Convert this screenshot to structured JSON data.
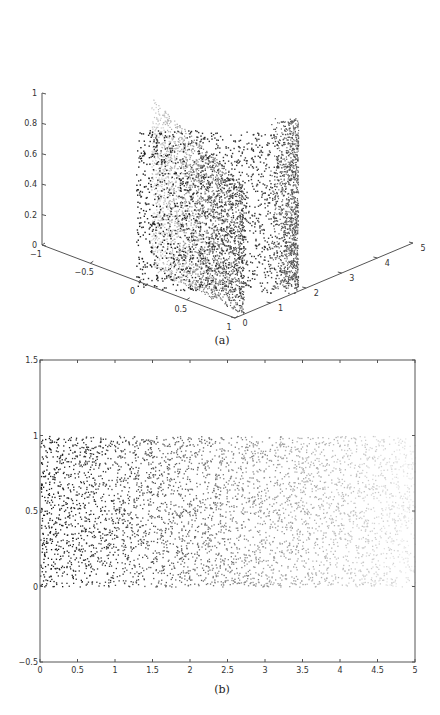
{
  "chart_data": [
    {
      "id": "a",
      "type": "scatter",
      "projection": "3d",
      "caption": "(a)",
      "title": "",
      "xlabel": "",
      "ylabel": "",
      "zlabel": "",
      "xlim": [
        -1,
        1
      ],
      "ylim": [
        0,
        5
      ],
      "zlim": [
        0,
        1
      ],
      "x_ticks": [
        "-1",
        "-0.5",
        "0",
        "0.5",
        "1"
      ],
      "y_ticks": [
        "0",
        "1",
        "2",
        "3",
        "4",
        "5"
      ],
      "z_ticks": [
        "0",
        "0.2",
        "0.4",
        "0.6",
        "0.8",
        "1"
      ],
      "grid": false,
      "description": "Points uniformly filling a vertical planar sheet x in [0,1], z in [0,1] at small y (dark), bending into a second sheet extending in y from ~0 to ~2 (lighter gray, denser near the fold); color fades from black to light gray with increasing y.",
      "series": [
        {
          "name": "sheet-front",
          "x_range": [
            0,
            1
          ],
          "y_range": [
            0,
            0.2
          ],
          "z_range": [
            0,
            0.75
          ],
          "color": "#222222"
        },
        {
          "name": "sheet-rear",
          "x_range": [
            0.95,
            1
          ],
          "y_range": [
            0,
            2
          ],
          "z_range": [
            0,
            1
          ],
          "color_gradient": [
            "#333333",
            "#cccccc"
          ]
        }
      ]
    },
    {
      "id": "b",
      "type": "scatter",
      "caption": "(b)",
      "title": "",
      "xlabel": "",
      "ylabel": "",
      "xlim": [
        0,
        5
      ],
      "ylim": [
        -0.5,
        1.5
      ],
      "x_ticks": [
        "0",
        "0.5",
        "1",
        "1.5",
        "2",
        "2.5",
        "3",
        "3.5",
        "4",
        "4.5",
        "5"
      ],
      "y_ticks": [
        "-0.5",
        "0",
        "0.5",
        "1",
        "1.5"
      ],
      "grid": false,
      "description": "2D embedding: points uniformly fill the rectangle x in [0,5], y in [0,1]; color fades from black at x=0 to near white at x=5.",
      "series": [
        {
          "name": "embedded-points",
          "x_range": [
            0,
            5
          ],
          "y_range": [
            0,
            1
          ],
          "color_gradient": [
            "#111111",
            "#f0f0f0"
          ]
        }
      ]
    }
  ]
}
